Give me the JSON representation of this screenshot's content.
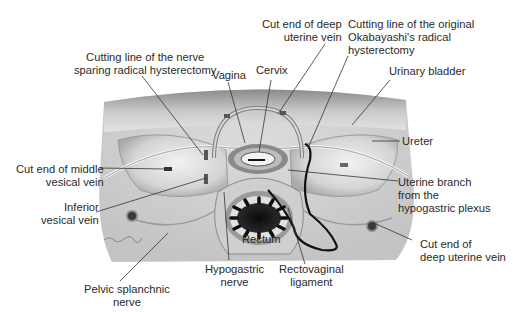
{
  "figure": {
    "type": "anatomical-illustration"
  },
  "labels": {
    "cut_end_deep_uterine_vein_top": [
      "Cut end of deep",
      "uterine vein"
    ],
    "cutting_line_okabayashi": [
      "Cutting line of the original",
      "Okabayashi's radical",
      "hysterectomy"
    ],
    "cutting_line_nerve_sparing": [
      "Cutting line of the nerve",
      "sparing radical hysterectomy"
    ],
    "vagina": "Vagina",
    "cervix": "Cervix",
    "urinary_bladder": "Urinary bladder",
    "ureter": "Ureter",
    "cut_end_middle_vesical_vein": [
      "Cut end of middle",
      "vesical vein"
    ],
    "inferior_vesical_vein": [
      "Inferior",
      "vesical vein"
    ],
    "uterine_branch": [
      "Uterine branch",
      "from the",
      "hypogastric plexus"
    ],
    "rectum": "Rectum",
    "cut_end_deep_uterine_vein_bottom": [
      "Cut end of",
      "deep uterine vein"
    ],
    "pelvic_splanchnic_nerve": [
      "Pelvic splanchnic",
      "nerve"
    ],
    "hypogastric_nerve": [
      "Hypogastric",
      "nerve"
    ],
    "rectovaginal_ligament": [
      "Rectovaginal",
      "ligament"
    ]
  },
  "colors": {
    "background": "#ffffff",
    "tissue_light": "#e6e6e6",
    "tissue_mid": "#bdbdbd",
    "tissue_dark": "#6e6e6e",
    "cutting_line": "#111111",
    "leader_line": "#333333"
  }
}
